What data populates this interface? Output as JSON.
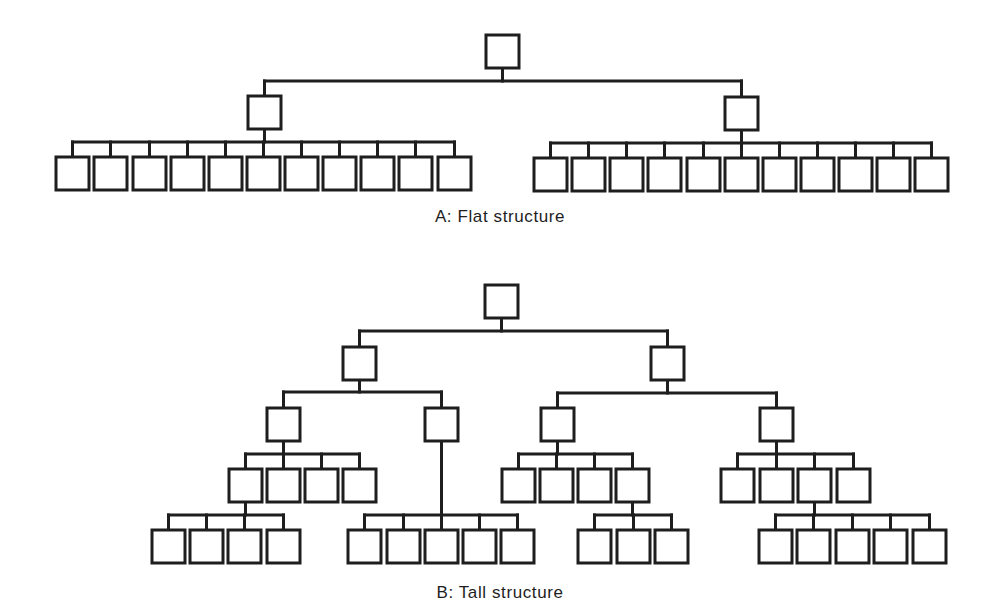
{
  "style": {
    "stroke_color": "#1e1e1e",
    "box_fill": "#ffffff",
    "background": "#ffffff",
    "stroke_width": 3,
    "box_size": 33
  },
  "diagrams": [
    {
      "id": "flat",
      "caption": "A: Flat structure",
      "caption_pos": [
        500,
        220
      ],
      "nodes": [
        {
          "id": "A0",
          "x": 486,
          "y": 35,
          "children": [
            "A1",
            "A2"
          ],
          "bar_y": 81
        },
        {
          "id": "A1",
          "x": 248,
          "y": 96,
          "bar_y": 142,
          "children": [
            "A1a",
            "A1b",
            "A1c",
            "A1d",
            "A1e",
            "A1f",
            "A1g",
            "A1h",
            "A1i",
            "A1j",
            "A1k"
          ]
        },
        {
          "id": "A2",
          "x": 725,
          "y": 97,
          "bar_y": 143,
          "children": [
            "A2a",
            "A2b",
            "A2c",
            "A2d",
            "A2e",
            "A2f",
            "A2g",
            "A2h",
            "A2i",
            "A2j",
            "A2k"
          ]
        },
        {
          "id": "A1a",
          "x": 56,
          "y": 157
        },
        {
          "id": "A1b",
          "x": 94,
          "y": 157
        },
        {
          "id": "A1c",
          "x": 133,
          "y": 157
        },
        {
          "id": "A1d",
          "x": 171,
          "y": 157
        },
        {
          "id": "A1e",
          "x": 209,
          "y": 157
        },
        {
          "id": "A1f",
          "x": 247,
          "y": 157
        },
        {
          "id": "A1g",
          "x": 285,
          "y": 157
        },
        {
          "id": "A1h",
          "x": 323,
          "y": 157
        },
        {
          "id": "A1i",
          "x": 361,
          "y": 157
        },
        {
          "id": "A1j",
          "x": 399,
          "y": 157
        },
        {
          "id": "A1k",
          "x": 438,
          "y": 157
        },
        {
          "id": "A2a",
          "x": 534,
          "y": 158
        },
        {
          "id": "A2b",
          "x": 572,
          "y": 158
        },
        {
          "id": "A2c",
          "x": 610,
          "y": 158
        },
        {
          "id": "A2d",
          "x": 648,
          "y": 158
        },
        {
          "id": "A2e",
          "x": 687,
          "y": 158
        },
        {
          "id": "A2f",
          "x": 725,
          "y": 158
        },
        {
          "id": "A2g",
          "x": 763,
          "y": 158
        },
        {
          "id": "A2h",
          "x": 801,
          "y": 158
        },
        {
          "id": "A2i",
          "x": 839,
          "y": 158
        },
        {
          "id": "A2j",
          "x": 877,
          "y": 158
        },
        {
          "id": "A2k",
          "x": 915,
          "y": 158
        }
      ]
    },
    {
      "id": "tall",
      "caption": "B: Tall structure",
      "caption_pos": [
        500,
        596
      ],
      "nodes": [
        {
          "id": "B0",
          "x": 485,
          "y": 285,
          "children": [
            "B1",
            "B2"
          ],
          "bar_y": 331
        },
        {
          "id": "B1",
          "x": 343,
          "y": 347,
          "children": [
            "B11",
            "B12"
          ],
          "bar_y": 392
        },
        {
          "id": "B2",
          "x": 651,
          "y": 347,
          "children": [
            "B21",
            "B22"
          ],
          "bar_y": 393
        },
        {
          "id": "B11",
          "x": 267,
          "y": 408,
          "children": [
            "B111",
            "B112",
            "B113",
            "B114"
          ],
          "bar_y": 454
        },
        {
          "id": "B12",
          "x": 425,
          "y": 408,
          "children": [
            "B121",
            "B122",
            "B123",
            "B124",
            "B125"
          ],
          "bar_y": 515
        },
        {
          "id": "B21",
          "x": 541,
          "y": 408,
          "children": [
            "B211",
            "B212",
            "B213",
            "B214"
          ],
          "bar_y": 454
        },
        {
          "id": "B22",
          "x": 760,
          "y": 408,
          "children": [
            "B221",
            "B222",
            "B223",
            "B224"
          ],
          "bar_y": 454
        },
        {
          "id": "B111",
          "x": 229,
          "y": 469,
          "children": [
            "B1111",
            "B1112",
            "B1113",
            "B1114"
          ],
          "bar_y": 515
        },
        {
          "id": "B112",
          "x": 267,
          "y": 469
        },
        {
          "id": "B113",
          "x": 305,
          "y": 469
        },
        {
          "id": "B114",
          "x": 343,
          "y": 469
        },
        {
          "id": "B1111",
          "x": 152,
          "y": 530
        },
        {
          "id": "B1112",
          "x": 190,
          "y": 530
        },
        {
          "id": "B1113",
          "x": 228,
          "y": 530
        },
        {
          "id": "B1114",
          "x": 267,
          "y": 530
        },
        {
          "id": "B121",
          "x": 348,
          "y": 530
        },
        {
          "id": "B122",
          "x": 387,
          "y": 530
        },
        {
          "id": "B123",
          "x": 425,
          "y": 530
        },
        {
          "id": "B124",
          "x": 463,
          "y": 530
        },
        {
          "id": "B125",
          "x": 501,
          "y": 530
        },
        {
          "id": "B211",
          "x": 502,
          "y": 469
        },
        {
          "id": "B212",
          "x": 540,
          "y": 469
        },
        {
          "id": "B213",
          "x": 578,
          "y": 469
        },
        {
          "id": "B214",
          "x": 616,
          "y": 469,
          "children": [
            "B2141",
            "B2142",
            "B2143"
          ],
          "bar_y": 515
        },
        {
          "id": "B2141",
          "x": 578,
          "y": 530
        },
        {
          "id": "B2142",
          "x": 617,
          "y": 530
        },
        {
          "id": "B2143",
          "x": 655,
          "y": 530
        },
        {
          "id": "B221",
          "x": 721,
          "y": 469
        },
        {
          "id": "B222",
          "x": 760,
          "y": 469
        },
        {
          "id": "B223",
          "x": 798,
          "y": 469,
          "children": [
            "B2231",
            "B2232",
            "B2233",
            "B2234",
            "B2235"
          ],
          "bar_y": 515
        },
        {
          "id": "B224",
          "x": 837,
          "y": 469
        },
        {
          "id": "B2231",
          "x": 759,
          "y": 530
        },
        {
          "id": "B2232",
          "x": 797,
          "y": 530
        },
        {
          "id": "B2233",
          "x": 836,
          "y": 530
        },
        {
          "id": "B2234",
          "x": 874,
          "y": 530
        },
        {
          "id": "B2235",
          "x": 913,
          "y": 530
        }
      ]
    }
  ]
}
